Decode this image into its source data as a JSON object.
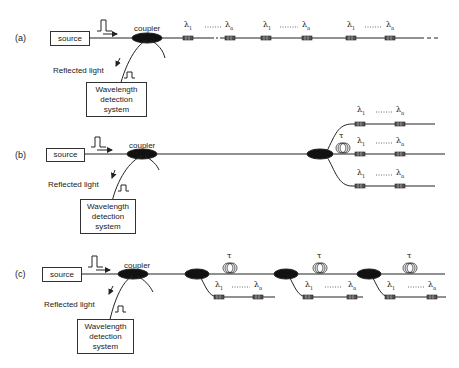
{
  "panels": [
    {
      "id": "a",
      "label": "(a)",
      "source": "source",
      "coupler": "coupler",
      "reflected": "Reflected light",
      "detector": [
        "Wavelength",
        "detection",
        "system"
      ],
      "topology": "serial",
      "gratings": [
        [
          "λ1",
          "λn"
        ],
        [
          "λ1",
          "λn"
        ],
        [
          "λ1",
          "λn"
        ]
      ]
    },
    {
      "id": "b",
      "label": "(b)",
      "source": "source",
      "coupler": "coupler",
      "reflected": "Reflected light",
      "detector": [
        "Wavelength",
        "detection",
        "system"
      ],
      "topology": "parallel-star",
      "delay": "τ",
      "gratings": [
        [
          "λ1",
          "λn"
        ],
        [
          "λ1",
          "λn"
        ],
        [
          "λ1",
          "λn"
        ]
      ]
    },
    {
      "id": "c",
      "label": "(c)",
      "source": "source",
      "coupler": "coupler",
      "reflected": "Reflected light",
      "detector": [
        "Wavelength",
        "detection",
        "system"
      ],
      "topology": "ladder",
      "delay": "τ",
      "gratings": [
        [
          "λ1",
          "λn"
        ],
        [
          "λ1",
          "λn"
        ],
        [
          "λ1",
          "λn"
        ]
      ]
    }
  ],
  "symbols": {
    "lambda_first": "λ",
    "sub_1": "1",
    "sub_n": "n",
    "tau": "τ",
    "dots": "·······"
  }
}
